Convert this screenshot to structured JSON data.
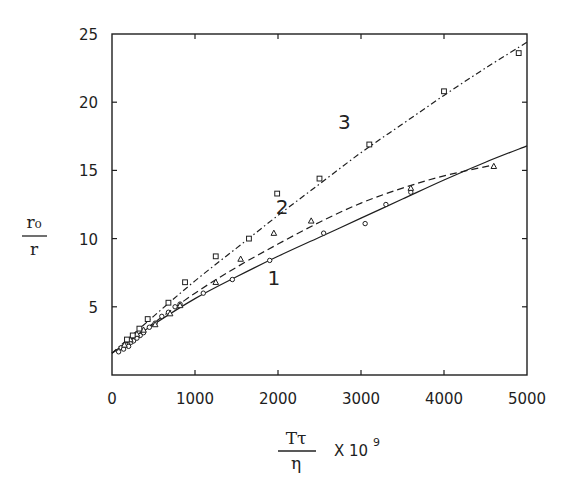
{
  "chart_data": {
    "type": "line",
    "title": "",
    "xlabel": "Tτ/η × 10^9",
    "ylabel": "r₀/r",
    "xlabel_parts": {
      "numerator": "Tτ",
      "denominator": "η",
      "suffix": "X 10",
      "exponent": "9"
    },
    "ylabel_parts": {
      "numerator": "r₀",
      "denominator": "r"
    },
    "xlim": [
      0,
      5000
    ],
    "ylim": [
      0,
      25
    ],
    "x_ticks": [
      0,
      1000,
      2000,
      3000,
      4000,
      5000
    ],
    "x_tick_labels": [
      "0",
      "1000",
      "2000",
      "3000",
      "4000",
      "5000"
    ],
    "y_ticks": [
      5,
      10,
      15,
      20,
      25
    ],
    "y_tick_labels": [
      "5",
      "10",
      "15",
      "20",
      "25"
    ],
    "grid": false,
    "legend": "none (curves labeled inline 1, 2, 3)",
    "series": [
      {
        "name": "1",
        "line_style": "solid",
        "marker": "circle",
        "fit_curve": {
          "x": [
            0,
            500,
            1000,
            1500,
            2000,
            2500,
            3000,
            3500,
            4000,
            4500,
            5000
          ],
          "y": [
            1.6,
            3.7,
            5.6,
            7.2,
            8.7,
            10.1,
            11.5,
            12.9,
            14.3,
            15.6,
            16.8
          ]
        },
        "points": {
          "x": [
            80,
            110,
            140,
            170,
            200,
            230,
            260,
            300,
            340,
            380,
            450,
            520,
            600,
            680,
            760,
            820,
            1100,
            1450,
            1900,
            2550,
            3050,
            3300,
            3600
          ],
          "y": [
            1.7,
            2.0,
            1.9,
            2.2,
            2.1,
            2.4,
            2.5,
            2.7,
            2.9,
            3.1,
            3.5,
            3.8,
            4.3,
            4.6,
            5.0,
            5.2,
            6.0,
            7.0,
            8.4,
            10.4,
            11.1,
            12.5,
            13.4
          ]
        }
      },
      {
        "name": "2",
        "line_style": "dashed",
        "marker": "triangle",
        "fit_curve": {
          "x": [
            0,
            500,
            1000,
            1500,
            2000,
            2500,
            3000,
            3500,
            4000,
            4600
          ],
          "y": [
            1.6,
            3.8,
            6.0,
            7.9,
            9.6,
            11.2,
            12.6,
            13.7,
            14.6,
            15.4
          ]
        },
        "points": {
          "x": [
            150,
            220,
            300,
            380,
            520,
            700,
            820,
            1250,
            1550,
            1950,
            2400,
            3600,
            4600
          ],
          "y": [
            2.2,
            2.6,
            3.0,
            3.3,
            3.7,
            4.5,
            5.1,
            6.8,
            8.5,
            10.4,
            11.3,
            13.7,
            15.3
          ]
        }
      },
      {
        "name": "3",
        "line_style": "dash-dot",
        "marker": "square",
        "fit_curve": {
          "x": [
            0,
            500,
            1000,
            1500,
            2000,
            2500,
            3000,
            3500,
            4000,
            4500,
            5000
          ],
          "y": [
            1.6,
            4.3,
            6.9,
            9.3,
            11.7,
            14.0,
            16.3,
            18.4,
            20.5,
            22.5,
            24.4
          ]
        },
        "points": {
          "x": [
            180,
            250,
            330,
            430,
            680,
            880,
            1250,
            1650,
            1990,
            2500,
            3100,
            4000,
            4900
          ],
          "y": [
            2.6,
            2.9,
            3.4,
            4.1,
            5.3,
            6.8,
            8.7,
            10.0,
            13.3,
            14.4,
            16.9,
            20.8,
            23.6
          ]
        }
      }
    ],
    "annotations": [
      {
        "text": "1",
        "x": 1950,
        "y": 6.6
      },
      {
        "text": "2",
        "x": 2050,
        "y": 11.8
      },
      {
        "text": "3",
        "x": 2800,
        "y": 18.0
      }
    ]
  },
  "colors": {
    "ink": "#1e1e1e",
    "background": "#ffffff"
  }
}
